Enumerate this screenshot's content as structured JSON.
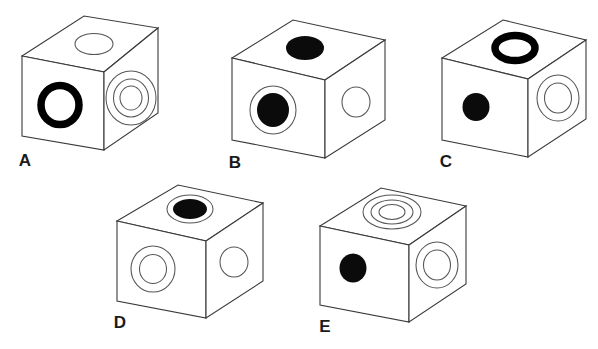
{
  "figure": {
    "background_color": "#ffffff",
    "line_color": "#3a3a3a",
    "mark_color": "#000000",
    "cube_count": 5
  },
  "cubes": [
    {
      "label": "A",
      "top_face": {
        "symbol": "open-circle",
        "description": "thin outlined circle"
      },
      "front_face": {
        "symbol": "thick-black-ring",
        "description": "thick black donut ring"
      },
      "right_face": {
        "symbol": "triple-concentric-circles",
        "description": "three thin concentric circles"
      }
    },
    {
      "label": "B",
      "top_face": {
        "symbol": "solid-black-circle",
        "description": "filled black circle"
      },
      "front_face": {
        "symbol": "solid-dot-in-ring",
        "description": "filled black circle inside a thin outline ring"
      },
      "right_face": {
        "symbol": "open-circle",
        "description": "thin outlined circle"
      }
    },
    {
      "label": "C",
      "top_face": {
        "symbol": "thick-black-ring",
        "description": "thick black donut ring"
      },
      "front_face": {
        "symbol": "solid-black-circle",
        "description": "small filled black dot"
      },
      "right_face": {
        "symbol": "double-concentric-circles",
        "description": "two thin concentric circles"
      }
    },
    {
      "label": "D",
      "top_face": {
        "symbol": "solid-dot-in-ring",
        "description": "filled black circle inside a thin outline ring"
      },
      "front_face": {
        "symbol": "double-concentric-circles",
        "description": "two thin concentric circles"
      },
      "right_face": {
        "symbol": "open-circle",
        "description": "thin outlined circle"
      }
    },
    {
      "label": "E",
      "top_face": {
        "symbol": "triple-concentric-circles",
        "description": "three thin concentric circles"
      },
      "front_face": {
        "symbol": "solid-black-circle",
        "description": "small filled black dot"
      },
      "right_face": {
        "symbol": "double-concentric-circles",
        "description": "two thin concentric circles"
      }
    }
  ]
}
